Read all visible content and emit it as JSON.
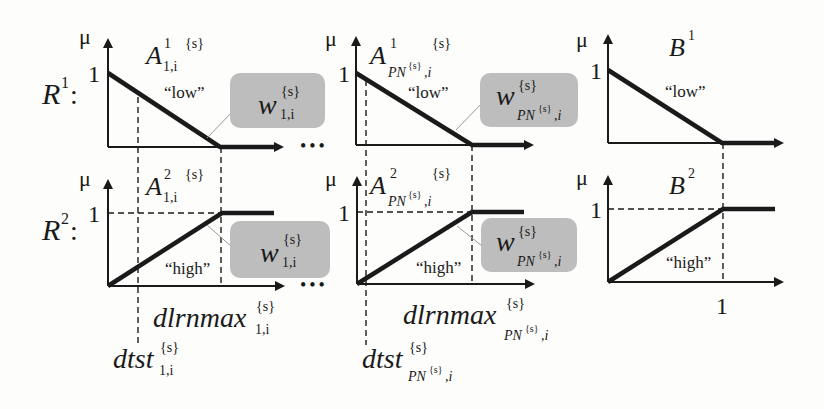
{
  "rules": [
    {
      "label_base": "R",
      "label_sup": "1",
      "colon": ":"
    },
    {
      "label_base": "R",
      "label_sup": "2",
      "colon": ":"
    }
  ],
  "axis": {
    "mu": "μ",
    "one": "1"
  },
  "sets": {
    "a11": {
      "base": "A",
      "sup": "1",
      "sub": "1,i",
      "tag": "{s}",
      "term": "“low”"
    },
    "a21": {
      "base": "A",
      "sup": "2",
      "sub": "1,i",
      "tag": "{s}",
      "term": "“high”"
    },
    "apn1": {
      "base": "A",
      "sup": "1",
      "sub_pre": "PN",
      "sub_sup": "{s}",
      "sub_post": ",i",
      "tag": "{s}",
      "term": "“low”"
    },
    "apn2": {
      "base": "A",
      "sup": "2",
      "sub_pre": "PN",
      "sub_sup": "{s}",
      "sub_post": ",i",
      "tag": "{s}",
      "term": "“high”"
    },
    "b1": {
      "base": "B",
      "sup": "1",
      "term": "“low”"
    },
    "b2": {
      "base": "B",
      "sup": "2",
      "term": "“high”"
    }
  },
  "weights": {
    "w1": {
      "base": "w",
      "sup": "{s}",
      "sub": "1,i"
    },
    "wpn": {
      "base": "w",
      "sup": "{s}",
      "sub_pre": "PN",
      "sub_sup": "{s}",
      "sub_post": ",i"
    }
  },
  "xlabels": {
    "dlrnmax_1": {
      "base": "dlrnmax",
      "sup": "{s}",
      "sub": "1,i"
    },
    "dtst_1": {
      "base": "dtst",
      "sup": "{s}",
      "sub": "1,i"
    },
    "dlrnmax_pn": {
      "base": "dlrnmax",
      "sup": "{s}",
      "sub_pre": "PN",
      "sub_sup": "{s}",
      "sub_post": ",i"
    },
    "dtst_pn": {
      "base": "dtst",
      "sup": "{s}",
      "sub_pre": "PN",
      "sub_sup": "{s}",
      "sub_post": ",i"
    },
    "b_one": "1"
  },
  "ellipsis": "•••",
  "colors": {
    "ink": "#1a1a1a",
    "weight_box": "#bdbdbd",
    "leader": "#9a9a9a"
  }
}
